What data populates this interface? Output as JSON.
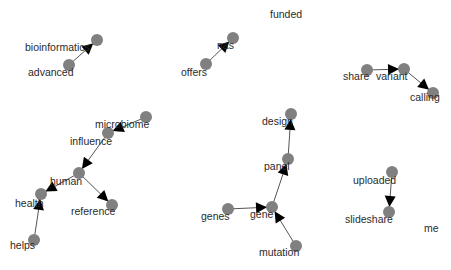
{
  "graph": {
    "node_color": "#808080",
    "edge_color": "#555555",
    "arrow_color": "#000000",
    "nodes": [
      {
        "id": "bioinformatics",
        "label": "bioinformatics",
        "x": 97,
        "y": 40,
        "lx": 25,
        "ly": 41
      },
      {
        "id": "advanced",
        "label": "advanced",
        "x": 69,
        "y": 65,
        "lx": 28,
        "ly": 66
      },
      {
        "id": "nas",
        "label": "nas",
        "x": 233,
        "y": 38,
        "lx": 217,
        "ly": 39
      },
      {
        "id": "offers",
        "label": "offers",
        "x": 206,
        "y": 64,
        "lx": 181,
        "ly": 66
      },
      {
        "id": "share",
        "label": "share",
        "x": 367,
        "y": 70,
        "lx": 343,
        "ly": 70
      },
      {
        "id": "variant",
        "label": "variant",
        "x": 404,
        "y": 69,
        "lx": 376,
        "ly": 70
      },
      {
        "id": "calling",
        "label": "calling",
        "x": 433,
        "y": 93,
        "lx": 410,
        "ly": 91
      },
      {
        "id": "microbiome",
        "label": "microbiome",
        "x": 146,
        "y": 117,
        "lx": 95,
        "ly": 118
      },
      {
        "id": "influence",
        "label": "influence",
        "x": 108,
        "y": 133,
        "lx": 70,
        "ly": 135
      },
      {
        "id": "human",
        "label": "human",
        "x": 79,
        "y": 173,
        "lx": 50,
        "ly": 175
      },
      {
        "id": "health",
        "label": "health",
        "x": 41,
        "y": 194,
        "lx": 15,
        "ly": 197
      },
      {
        "id": "reference",
        "label": "reference",
        "x": 112,
        "y": 205,
        "lx": 71,
        "ly": 205
      },
      {
        "id": "helps",
        "label": "helps",
        "x": 34,
        "y": 240,
        "lx": 10,
        "ly": 239
      },
      {
        "id": "design",
        "label": "design",
        "x": 291,
        "y": 114,
        "lx": 262,
        "ly": 115
      },
      {
        "id": "panel",
        "label": "panel",
        "x": 288,
        "y": 159,
        "lx": 264,
        "ly": 160
      },
      {
        "id": "gene",
        "label": "gene",
        "x": 272,
        "y": 207,
        "lx": 250,
        "ly": 208
      },
      {
        "id": "genes",
        "label": "genes",
        "x": 228,
        "y": 209,
        "lx": 201,
        "ly": 210
      },
      {
        "id": "mutation",
        "label": "mutation",
        "x": 296,
        "y": 246,
        "lx": 259,
        "ly": 246
      },
      {
        "id": "uploaded",
        "label": "uploaded",
        "x": 392,
        "y": 172,
        "lx": 353,
        "ly": 174
      },
      {
        "id": "slideshare",
        "label": "slideshare",
        "x": 389,
        "y": 212,
        "lx": 345,
        "ly": 213
      }
    ],
    "isolated_labels": [
      {
        "label": "funded",
        "lx": 270,
        "ly": 8
      },
      {
        "label": "me",
        "lx": 424,
        "ly": 222
      }
    ],
    "edges": [
      {
        "from": "advanced",
        "to": "bioinformatics"
      },
      {
        "from": "offers",
        "to": "nas"
      },
      {
        "from": "share",
        "to": "variant"
      },
      {
        "from": "variant",
        "to": "calling"
      },
      {
        "from": "microbiome",
        "to": "influence"
      },
      {
        "from": "influence",
        "to": "human"
      },
      {
        "from": "human",
        "to": "health"
      },
      {
        "from": "human",
        "to": "reference"
      },
      {
        "from": "helps",
        "to": "health"
      },
      {
        "from": "panel",
        "to": "design"
      },
      {
        "from": "gene",
        "to": "panel"
      },
      {
        "from": "genes",
        "to": "gene"
      },
      {
        "from": "mutation",
        "to": "gene"
      },
      {
        "from": "uploaded",
        "to": "slideshare"
      }
    ]
  }
}
